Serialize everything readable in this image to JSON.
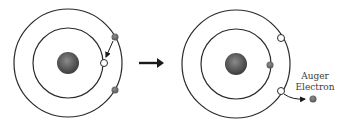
{
  "diagram": {
    "before": {
      "nucleus_color": "#5a5a5a",
      "electrons": [
        "outer-shell-electron-top",
        "outer-shell-electron-bottom"
      ],
      "vacancy": "inner-shell-vacancy"
    },
    "transition_arrow": "right-arrow",
    "after": {
      "nucleus_color": "#5a5a5a",
      "electrons": [
        "inner-shell-electron"
      ],
      "vacancies": [
        "outer-shell-vacancy-top",
        "outer-shell-vacancy-bottom"
      ],
      "emitted_label_line1": "Auger",
      "emitted_label_line2": "Electron"
    },
    "colors": {
      "orbit": "#2a2a2a",
      "electron": "#6b6b6b",
      "vacancy_fill": "#ffffff",
      "arrow": "#1a1a1a"
    }
  }
}
